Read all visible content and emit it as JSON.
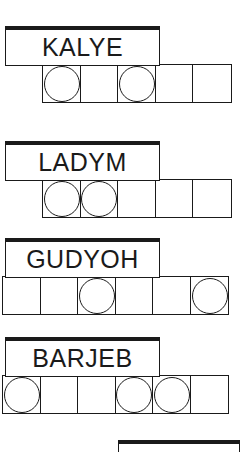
{
  "page": {
    "background_color": "#ffffff",
    "ink_color": "#1a1a1a",
    "width": 251,
    "height": 448
  },
  "groups": [
    {
      "id": "group-kalye",
      "word": "KALYE",
      "letter_count": 5,
      "label_box": {
        "left": 5,
        "top": 26,
        "width": 155,
        "height": 40
      },
      "cell_strip": {
        "left": 42,
        "top": 64,
        "cell_count": 5,
        "cell_size": 39.2
      },
      "circle_positions": [
        1,
        3
      ],
      "cells": [
        {
          "index": 1,
          "circle": true
        },
        {
          "index": 2,
          "circle": false
        },
        {
          "index": 3,
          "circle": true
        },
        {
          "index": 4,
          "circle": false
        },
        {
          "index": 5,
          "circle": false
        }
      ]
    },
    {
      "id": "group-ladym",
      "word": "LADYM",
      "letter_count": 5,
      "label_box": {
        "left": 5,
        "top": 141,
        "width": 155,
        "height": 40
      },
      "cell_strip": {
        "left": 42,
        "top": 179,
        "cell_count": 5,
        "cell_size": 39.2
      },
      "circle_positions": [
        1,
        2
      ],
      "cells": [
        {
          "index": 1,
          "circle": true
        },
        {
          "index": 2,
          "circle": true
        },
        {
          "index": 3,
          "circle": false
        },
        {
          "index": 4,
          "circle": false
        },
        {
          "index": 5,
          "circle": false
        }
      ]
    },
    {
      "id": "group-gudyoh",
      "word": "GUDYOH",
      "letter_count": 6,
      "label_box": {
        "left": 5,
        "top": 238,
        "width": 155,
        "height": 40
      },
      "cell_strip": {
        "left": 2,
        "top": 276,
        "cell_count": 6,
        "cell_size": 39.2
      },
      "circle_positions": [
        3,
        6
      ],
      "cells": [
        {
          "index": 1,
          "circle": false
        },
        {
          "index": 2,
          "circle": false
        },
        {
          "index": 3,
          "circle": true
        },
        {
          "index": 4,
          "circle": false
        },
        {
          "index": 5,
          "circle": false
        },
        {
          "index": 6,
          "circle": true
        }
      ]
    },
    {
      "id": "group-barjeb",
      "word": "BARJEB",
      "letter_count": 6,
      "label_box": {
        "left": 5,
        "top": 337,
        "width": 155,
        "height": 40
      },
      "cell_strip": {
        "left": 2,
        "top": 375,
        "cell_count": 6,
        "cell_size": 39.2
      },
      "circle_positions": [
        1,
        4,
        5
      ],
      "cells": [
        {
          "index": 1,
          "circle": true
        },
        {
          "index": 2,
          "circle": false
        },
        {
          "index": 3,
          "circle": false
        },
        {
          "index": 4,
          "circle": true
        },
        {
          "index": 5,
          "circle": true
        },
        {
          "index": 6,
          "circle": false
        }
      ]
    }
  ],
  "partial_group": {
    "id": "group-partial-cutoff",
    "word": "",
    "label_box": {
      "left": 118,
      "top": 440,
      "width": 122,
      "height": 12
    }
  }
}
